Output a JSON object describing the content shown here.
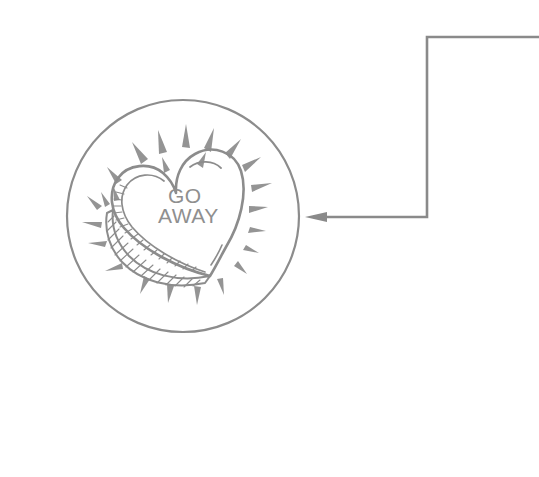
{
  "canvas": {
    "width": 539,
    "height": 477,
    "background_color": "#ffffff",
    "ink_color": "#8c8c8c",
    "ink_fill_color": "#949494",
    "connector_color": "#8a8a8a"
  },
  "illustration": {
    "name": "go-away-candy-heart",
    "style": "hand-drawn pencil sketch, grayscale line art",
    "badge": {
      "shape": "circle",
      "center_x": 183,
      "center_y": 216,
      "radius": 116,
      "stroke_width": 2.2
    },
    "heart": {
      "label": "conversation heart candy",
      "bottom_point_x": 210,
      "bottom_point_y": 276,
      "has_inner_contour": true,
      "has_side_thickness_hatching": true,
      "has_highlight_stroke": true
    },
    "candy_text": {
      "line1": "GO",
      "line2": "AWAY",
      "full": "GO AWAY",
      "line1_x": 168,
      "line1_y": 203,
      "line2_x": 160,
      "line2_y": 222,
      "font_size_1": 21,
      "font_size_2": 21
    },
    "rays": {
      "description": "radiating triangular sparkle wedges around the heart",
      "count": 24
    }
  },
  "connector": {
    "name": "callout-arrow",
    "type": "orthogonal-polyline",
    "direction": "points-left-into-badge",
    "points": "539,37 427,37 427,217 307,217",
    "arrow_tip_x": 305,
    "arrow_tip_y": 217,
    "stroke_width": 2.6
  }
}
